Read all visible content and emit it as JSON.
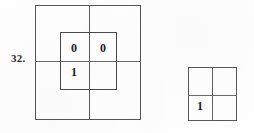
{
  "page": {
    "width": 254,
    "height": 133,
    "background_color": "#fefefe",
    "ink_color": "#333333"
  },
  "problem": {
    "number_label": "32."
  },
  "figures": [
    {
      "id": "figure-a",
      "description": "large square divided into four quadrants with a smaller concentric square also divided into four quadrants",
      "outer_square": {
        "divided": "four quadrants",
        "cells": [
          "",
          "",
          "",
          ""
        ]
      },
      "inner_square": {
        "divided": "four quadrants",
        "cells": {
          "top_left": "0",
          "top_right": "0",
          "bottom_left": "1",
          "bottom_right": ""
        }
      }
    },
    {
      "id": "figure-b",
      "description": "small square divided into four quadrants",
      "outer_square": {
        "divided": "four quadrants",
        "cells": {
          "top_left": "",
          "top_right": "",
          "bottom_left": "1",
          "bottom_right": ""
        }
      }
    }
  ],
  "digits": {
    "fig_a_inner_top_left": "0",
    "fig_a_inner_top_right": "0",
    "fig_a_inner_bottom_left": "1",
    "fig_b_bottom_left": "1"
  }
}
